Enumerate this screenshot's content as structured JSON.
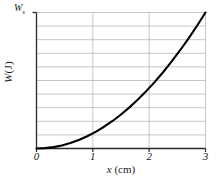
{
  "chart_data": {
    "type": "line",
    "title": "",
    "xlabel_symbol": "x",
    "xlabel_unit": "(cm)",
    "ylabel_symbol": "W",
    "ylabel_unit": "(J)",
    "xlabel": "x (cm)",
    "ylabel": "W (J)",
    "xlim": [
      0,
      3
    ],
    "ylim": [
      0,
      1
    ],
    "xticks": [
      0,
      1,
      2,
      3
    ],
    "xtick_labels": [
      "0",
      "1",
      "2",
      "3"
    ],
    "ytick_labels": [],
    "ymax_marker_symbol": "W",
    "ymax_marker_subscript": "s",
    "ymax_marker_label": "Ws",
    "grid": true,
    "grid_horizontal_count": 10,
    "grid_vertical_at": [
      1,
      2
    ],
    "legend": null,
    "series": [
      {
        "name": "W(x)",
        "shape": "quadratic",
        "color": "#000000",
        "x": [
          0.0,
          0.15,
          0.3,
          0.45,
          0.6,
          0.75,
          0.9,
          1.05,
          1.2,
          1.35,
          1.5,
          1.65,
          1.8,
          1.95,
          2.1,
          2.25,
          2.4,
          2.55,
          2.7,
          2.85,
          3.0
        ],
        "values": [
          0.0,
          0.0025,
          0.01,
          0.0225,
          0.04,
          0.0625,
          0.09,
          0.1225,
          0.16,
          0.2025,
          0.25,
          0.3025,
          0.36,
          0.4225,
          0.49,
          0.5625,
          0.64,
          0.7225,
          0.81,
          0.9025,
          1.0
        ]
      }
    ]
  },
  "colors": {
    "curve": "#000000",
    "axis": "#2a2a2a",
    "grid": "#b8b8b8",
    "background": "#ffffff"
  }
}
